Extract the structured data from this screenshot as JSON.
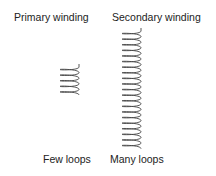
{
  "labels": {
    "primary": "Primary winding",
    "secondary": "Secondary winding",
    "primary_caption": "Few loops",
    "secondary_caption": "Many loops"
  },
  "coils": {
    "primary": {
      "loops": 5,
      "x": 60,
      "y_top": 67,
      "width": 19,
      "pitch": 5.6
    },
    "secondary": {
      "loops": 21,
      "x": 122,
      "y_top": 31,
      "width": 19,
      "pitch": 5.6
    }
  },
  "colors": {
    "stroke": "#444444",
    "text": "#222222"
  }
}
